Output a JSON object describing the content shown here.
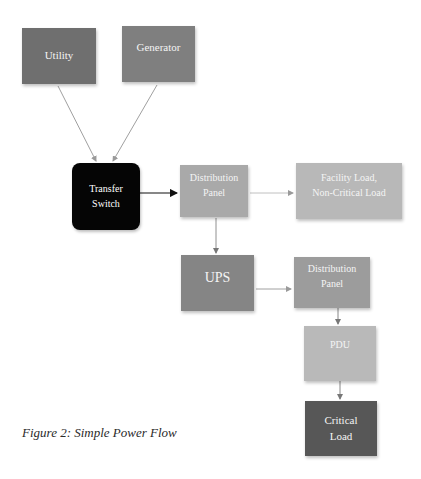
{
  "diagram": {
    "type": "flowchart",
    "title": "Simple Power Flow",
    "nodes": [
      {
        "id": "utility",
        "label_lines": [
          "Utility"
        ],
        "color": "#6f6f6f"
      },
      {
        "id": "generator",
        "label_lines": [
          "Generator"
        ],
        "color": "#7f7f7f"
      },
      {
        "id": "transfer_switch",
        "label_lines": [
          "Transfer",
          "Switch"
        ],
        "color": "#050505"
      },
      {
        "id": "distribution_panel_1",
        "label_lines": [
          "Distribution",
          "Panel"
        ],
        "color": "#a9a9a9"
      },
      {
        "id": "facility_load",
        "label_lines": [
          "Facility Load,",
          "Non-Critical Load"
        ],
        "color": "#b8b8b8"
      },
      {
        "id": "ups",
        "label_lines": [
          "UPS"
        ],
        "color": "#858585"
      },
      {
        "id": "distribution_panel_2",
        "label_lines": [
          "Distribution",
          "Panel"
        ],
        "color": "#9c9c9c"
      },
      {
        "id": "pdu",
        "label_lines": [
          "PDU"
        ],
        "color": "#b9b9b9"
      },
      {
        "id": "critical_load",
        "label_lines": [
          "Critical",
          "Load"
        ],
        "color": "#575757"
      }
    ],
    "edges": [
      {
        "from": "utility",
        "to": "transfer_switch"
      },
      {
        "from": "generator",
        "to": "transfer_switch"
      },
      {
        "from": "transfer_switch",
        "to": "distribution_panel_1"
      },
      {
        "from": "distribution_panel_1",
        "to": "facility_load"
      },
      {
        "from": "distribution_panel_1",
        "to": "ups"
      },
      {
        "from": "ups",
        "to": "distribution_panel_2"
      },
      {
        "from": "distribution_panel_2",
        "to": "pdu"
      },
      {
        "from": "pdu",
        "to": "critical_load"
      }
    ]
  },
  "labels": {
    "utility": "Utility",
    "generator": "Generator",
    "transfer_switch_1": "Transfer",
    "transfer_switch_2": "Switch",
    "dist_panel_1_1": "Distribution",
    "dist_panel_1_2": "Panel",
    "facility_load_1": "Facility Load,",
    "facility_load_2": "Non-Critical Load",
    "ups": "UPS",
    "dist_panel_2_1": "Distribution",
    "dist_panel_2_2": "Panel",
    "pdu": "PDU",
    "critical_load_1": "Critical",
    "critical_load_2": "Load"
  },
  "caption": "Figure 2: Simple Power Flow"
}
